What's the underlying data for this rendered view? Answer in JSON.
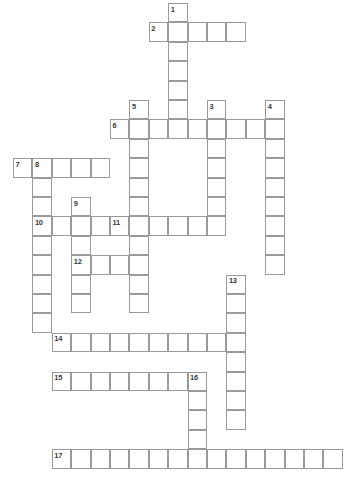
{
  "page": {
    "background_color": "#ffffff",
    "cell_border_color": "#9a9a9a",
    "number_color": "#3a3a3a",
    "artifact_text": "."
  },
  "grid": {
    "cell_size": 19.4,
    "origin_x": 13,
    "origin_y": 3,
    "columns": 17,
    "rows": 25
  },
  "chart_data": {
    "type": "table",
    "entries": [
      {
        "number": "1",
        "direction": "down",
        "col": 8,
        "row": 0,
        "length": 6
      },
      {
        "number": "2",
        "direction": "across",
        "col": 7,
        "row": 1,
        "length": 5
      },
      {
        "number": "3",
        "direction": "down",
        "col": 10,
        "row": 5,
        "length": 6
      },
      {
        "number": "4",
        "direction": "down",
        "col": 13,
        "row": 5,
        "length": 9
      },
      {
        "number": "5",
        "direction": "down",
        "col": 6,
        "row": 5,
        "length": 11
      },
      {
        "number": "6",
        "direction": "across",
        "col": 5,
        "row": 6,
        "length": 9
      },
      {
        "number": "7",
        "direction": "across",
        "col": 0,
        "row": 8,
        "length": 5
      },
      {
        "number": "8",
        "direction": "down",
        "col": 1,
        "row": 8,
        "length": 9
      },
      {
        "number": "9",
        "direction": "down",
        "col": 3,
        "row": 10,
        "length": 6
      },
      {
        "number": "10",
        "direction": "across",
        "col": 1,
        "row": 11,
        "length": 4
      },
      {
        "number": "11",
        "direction": "across",
        "col": 5,
        "row": 11,
        "length": 6
      },
      {
        "number": "12",
        "direction": "across",
        "col": 3,
        "row": 13,
        "length": 4
      },
      {
        "number": "13",
        "direction": "down",
        "col": 11,
        "row": 14,
        "length": 8
      },
      {
        "number": "14",
        "direction": "across",
        "col": 2,
        "row": 17,
        "length": 9
      },
      {
        "number": "15",
        "direction": "across",
        "col": 2,
        "row": 19,
        "length": 8
      },
      {
        "number": "16",
        "direction": "down",
        "col": 9,
        "row": 19,
        "length": 5
      },
      {
        "number": "17",
        "direction": "across",
        "col": 2,
        "row": 23,
        "length": 15
      }
    ],
    "numbered_cells": [
      {
        "number": "1",
        "col": 8,
        "row": 0
      },
      {
        "number": "2",
        "col": 7,
        "row": 1
      },
      {
        "number": "3",
        "col": 10,
        "row": 5
      },
      {
        "number": "4",
        "col": 13,
        "row": 5
      },
      {
        "number": "5",
        "col": 6,
        "row": 5
      },
      {
        "number": "6",
        "col": 5,
        "row": 6
      },
      {
        "number": "7",
        "col": 0,
        "row": 8
      },
      {
        "number": "8",
        "col": 1,
        "row": 8
      },
      {
        "number": "9",
        "col": 3,
        "row": 10
      },
      {
        "number": "10",
        "col": 1,
        "row": 11
      },
      {
        "number": "11",
        "col": 5,
        "row": 11
      },
      {
        "number": "12",
        "col": 3,
        "row": 13
      },
      {
        "number": "13",
        "col": 11,
        "row": 14
      },
      {
        "number": "14",
        "col": 2,
        "row": 17
      },
      {
        "number": "15",
        "col": 2,
        "row": 19
      },
      {
        "number": "16",
        "col": 9,
        "row": 19
      },
      {
        "number": "17",
        "col": 2,
        "row": 23
      }
    ],
    "letters": []
  }
}
